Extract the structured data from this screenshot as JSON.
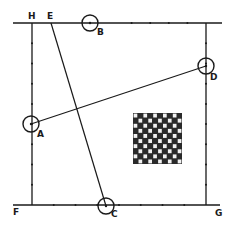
{
  "diagram": {
    "type": "geometric-linkage-sketch",
    "stroke_color": "#1a1a1a",
    "background": "#ffffff",
    "frame": {
      "top_line": {
        "x1": 13,
        "y1": 23,
        "x2": 222,
        "y2": 23
      },
      "left_line": {
        "x1": 32,
        "y1": 23,
        "x2": 32,
        "y2": 205
      },
      "right_line": {
        "x1": 206,
        "y1": 23,
        "x2": 206,
        "y2": 205
      },
      "bottom_line": {
        "x1": 13,
        "y1": 205,
        "x2": 220,
        "y2": 205
      }
    },
    "points": [
      {
        "id": "A",
        "label": "A",
        "cx": 31,
        "cy": 124,
        "circle": true,
        "label_x": 37,
        "label_y": 137
      },
      {
        "id": "B",
        "label": "B",
        "cx": 90,
        "cy": 23,
        "circle": true,
        "label_x": 97,
        "label_y": 35
      },
      {
        "id": "C",
        "label": "C",
        "cx": 106,
        "cy": 206,
        "circle": true,
        "label_x": 111,
        "label_y": 217
      },
      {
        "id": "D",
        "label": "D",
        "cx": 206,
        "cy": 66,
        "circle": true,
        "label_x": 210,
        "label_y": 80
      },
      {
        "id": "E",
        "label": "E",
        "cx": 51,
        "cy": 23,
        "circle": false,
        "label_x": 47,
        "label_y": 19
      },
      {
        "id": "F",
        "label": "F",
        "cx": 13,
        "cy": 205,
        "circle": false,
        "label_x": 13,
        "label_y": 215
      },
      {
        "id": "G",
        "label": "G",
        "cx": 220,
        "cy": 205,
        "circle": false,
        "label_x": 215,
        "label_y": 216
      },
      {
        "id": "H",
        "label": "H",
        "cx": 32,
        "cy": 23,
        "circle": false,
        "label_x": 28,
        "label_y": 19
      }
    ],
    "segments": [
      {
        "name": "segment-a-d",
        "from": "A",
        "to": "D"
      },
      {
        "name": "segment-e-c",
        "from": "E",
        "to": "C"
      }
    ],
    "checkerboard": {
      "x": 133,
      "y": 113,
      "width": 49,
      "height": 51,
      "cols": 10,
      "rows": 10
    }
  }
}
